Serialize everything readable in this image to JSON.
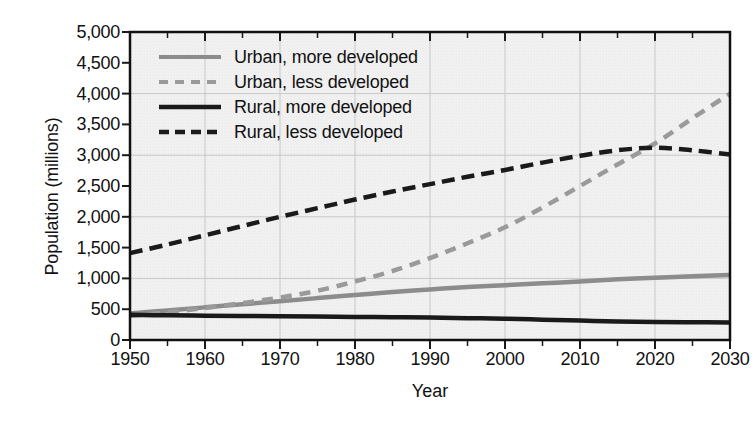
{
  "chart_data": {
    "type": "line",
    "title": "",
    "xlabel": "Year",
    "ylabel": "Population (millions)",
    "xlim": [
      1950,
      2030
    ],
    "ylim": [
      0,
      5000
    ],
    "xticks": [
      1950,
      1960,
      1970,
      1980,
      1990,
      2000,
      2010,
      2020,
      2030
    ],
    "xtick_labels": [
      "1950",
      "1960",
      "1970",
      "1980",
      "1990",
      "2000",
      "2010",
      "2020",
      "2030"
    ],
    "x_minor_tick_interval": 5,
    "yticks": [
      0,
      500,
      1000,
      1500,
      2000,
      2500,
      3000,
      3500,
      4000,
      4500,
      5000
    ],
    "ytick_labels": [
      "0",
      "500",
      "1,000",
      "1,500",
      "2,000",
      "2,500",
      "3,000",
      "3,500",
      "4,000",
      "4,500",
      "5,000"
    ],
    "grid": "both, gridlines at every 1,000 on y and every 10 years on x",
    "grid_color": "#c8c8c8",
    "plot_background": "#f2f2f2",
    "legend_position": "upper left inside plot",
    "x": [
      1950,
      1955,
      1960,
      1965,
      1970,
      1975,
      1980,
      1985,
      1990,
      1995,
      2000,
      2005,
      2010,
      2015,
      2020,
      2025,
      2030
    ],
    "series": [
      {
        "name": "Urban, more developed",
        "style": "solid",
        "color": "#8c8c8c",
        "values": [
          430,
          480,
          530,
          580,
          630,
          680,
          730,
          780,
          820,
          860,
          890,
          920,
          950,
          985,
          1010,
          1035,
          1055
        ]
      },
      {
        "name": "Urban, less developed",
        "style": "dashed",
        "color": "#9a9a9a",
        "values": [
          390,
          450,
          520,
          600,
          690,
          800,
          950,
          1120,
          1330,
          1570,
          1830,
          2150,
          2500,
          2850,
          3190,
          3600,
          4000
        ]
      },
      {
        "name": "Rural, more developed",
        "style": "solid",
        "color": "#1a1a1a",
        "values": [
          410,
          400,
          395,
          390,
          385,
          380,
          375,
          370,
          365,
          355,
          345,
          330,
          315,
          300,
          292,
          288,
          285
        ]
      },
      {
        "name": "Rural, less developed",
        "style": "dash-dot",
        "color": "#1a1a1a",
        "values": [
          1410,
          1550,
          1700,
          1850,
          2000,
          2140,
          2280,
          2410,
          2530,
          2650,
          2760,
          2880,
          2990,
          3080,
          3120,
          3080,
          3010
        ]
      }
    ]
  },
  "axes": {
    "y_title": "Population (millions)",
    "x_title": "Year"
  },
  "legend": {
    "items": [
      {
        "label": "Urban, more developed"
      },
      {
        "label": "Urban, less developed"
      },
      {
        "label": "Rural, more developed"
      },
      {
        "label": "Rural, less developed"
      }
    ]
  }
}
